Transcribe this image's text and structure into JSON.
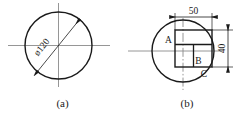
{
  "figure": {
    "style": {
      "line_color": "#1a1a1a",
      "center_line_color": "#7d7d7d",
      "background": "#ffffff",
      "text_color": "#1a1a1a"
    },
    "panels": [
      {
        "id": "a",
        "caption": "(a)",
        "shape": "circle",
        "dimensions": [
          {
            "name": "diameter",
            "label": "ø120",
            "value": 120,
            "symbol": "ø",
            "orientation": "diagonal",
            "arrows": "both-ends-inward"
          }
        ],
        "center_lines": [
          "horizontal",
          "vertical"
        ]
      },
      {
        "id": "b",
        "caption": "(b)",
        "shape": "circle-with-rectangle",
        "point_labels": [
          "A",
          "B",
          "C"
        ],
        "dimensions": [
          {
            "name": "width",
            "label": "50",
            "value": 50,
            "orientation": "horizontal",
            "position": "top",
            "arrows": "both-ends-outward"
          },
          {
            "name": "height",
            "label": "40",
            "value": 40,
            "orientation": "vertical-rotated",
            "position": "right",
            "arrows": "both-ends-outward"
          }
        ],
        "center_lines": [
          "horizontal",
          "vertical"
        ]
      }
    ]
  }
}
